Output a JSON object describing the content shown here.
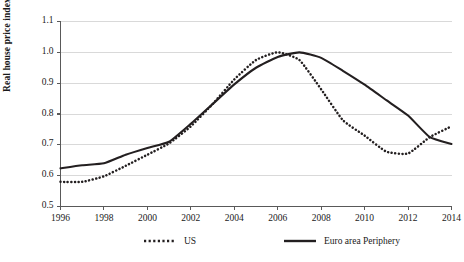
{
  "chart_data": {
    "type": "line",
    "title": "",
    "subtitle": "",
    "xlabel": "",
    "ylabel": "Real house price index",
    "xlim": [
      1996,
      2014
    ],
    "ylim": [
      0.5,
      1.1
    ],
    "grid": true,
    "grid_axis": "y",
    "legend_position": "bottom",
    "x": [
      1996,
      1997,
      1998,
      1999,
      2000,
      2001,
      2002,
      2003,
      2004,
      2005,
      2006,
      2007,
      2008,
      2009,
      2010,
      2011,
      2012,
      2013,
      2014
    ],
    "xticks": [
      "1996",
      "1998",
      "2000",
      "2002",
      "2004",
      "2006",
      "2008",
      "2010",
      "2012",
      "2014"
    ],
    "xtick_values": [
      1996,
      1998,
      2000,
      2002,
      2004,
      2006,
      2008,
      2010,
      2012,
      2014
    ],
    "yticks": [
      "0.5",
      "0.6",
      "0.7",
      "0.8",
      "0.9",
      "1.0",
      "1.1"
    ],
    "ytick_values": [
      0.5,
      0.6,
      0.7,
      0.8,
      0.9,
      1.0,
      1.1
    ],
    "series": [
      {
        "name": "US",
        "style": "dotted",
        "color": "#231f20",
        "values": [
          0.58,
          0.58,
          0.598,
          0.632,
          0.668,
          0.705,
          0.76,
          0.832,
          0.912,
          0.975,
          1.0,
          0.975,
          0.88,
          0.78,
          0.73,
          0.678,
          0.672,
          0.725,
          0.76
        ]
      },
      {
        "name": "Euro area Periphery",
        "style": "solid",
        "color": "#231f20",
        "values": [
          0.624,
          0.634,
          0.64,
          0.668,
          0.69,
          0.71,
          0.768,
          0.832,
          0.896,
          0.95,
          0.985,
          1.0,
          0.982,
          0.94,
          0.895,
          0.845,
          0.795,
          0.725,
          0.703
        ]
      }
    ]
  },
  "legend": {
    "items": [
      {
        "label": "US",
        "style": "dotted"
      },
      {
        "label": "Euro area Periphery",
        "style": "solid"
      }
    ]
  },
  "axes": {
    "y_axis_title": "Real house price index"
  },
  "colors": {
    "line": "#231f20",
    "grid": "#d9d9d9",
    "axis": "#595959",
    "background": "#ffffff"
  }
}
